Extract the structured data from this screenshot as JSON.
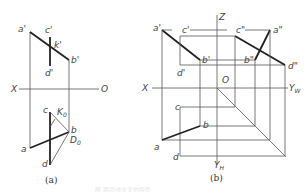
{
  "figure": {
    "panel_a": {
      "caption": "(a)",
      "axis_labels": {
        "x": "X",
        "o": "O"
      },
      "point_labels": {
        "a_prime": "a'",
        "b_prime": "b'",
        "c_prime": "c'",
        "d_prime": "d'",
        "k_prime": "k'",
        "a": "a",
        "b": "b",
        "c": "c",
        "d": "d",
        "K0": "K",
        "K0_sub": "0",
        "D0": "D",
        "D0_sub": "0"
      }
    },
    "panel_b": {
      "caption": "(b)",
      "axis_labels": {
        "z": "Z",
        "x": "X",
        "o": "O",
        "yw": "Y",
        "yw_sub": "W",
        "yh": "Y",
        "yh_sub": "H"
      },
      "point_labels": {
        "a_prime": "a'",
        "b_prime": "b'",
        "c_prime": "c'",
        "d_prime": "d'",
        "a_dprime": "a\"",
        "b_dprime": "b\"",
        "c_dprime": "c\"",
        "d_dprime": "d\"",
        "a": "a",
        "b": "b",
        "c": "c",
        "d": "d"
      }
    },
    "bottom_caption": "图 两直线交叉的投影"
  }
}
